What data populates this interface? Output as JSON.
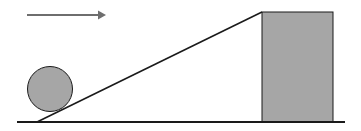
{
  "diagram": {
    "type": "physics-incline",
    "colors": {
      "background": "#ffffff",
      "line": "#1a1a1a",
      "fill": "#a6a6a6",
      "arrow": "#6e6e6e"
    },
    "arrow": {
      "x1": 27,
      "y1": 15,
      "x2": 106,
      "y2": 15,
      "direction": "right"
    },
    "ball": {
      "cx": 50,
      "cy": 89,
      "r": 22.5
    },
    "ground": {
      "x1": 17,
      "y1": 122,
      "x2": 345,
      "y2": 122
    },
    "incline": {
      "x1": 37,
      "y1": 122,
      "x2": 262,
      "y2": 12
    },
    "block": {
      "x": 262,
      "y": 12,
      "width": 71,
      "height": 110
    }
  }
}
